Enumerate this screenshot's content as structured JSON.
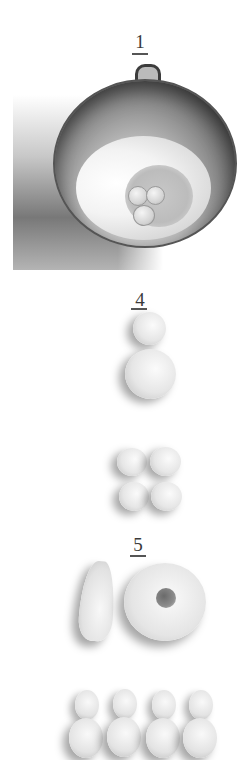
{
  "figure": {
    "steps": [
      {
        "number": "1",
        "subject": "Metal mixing bowl with flour and eggs in a well"
      },
      {
        "number": "4",
        "subject": "Dough balls: one small, one large, then four small balls in a 2x2 group"
      },
      {
        "number": "5",
        "subject": "Shaped dough: teardrop and ring (donut), then four peanut/figure-eight shapes in a row"
      }
    ],
    "palette": {
      "background": "#ffffff",
      "numeral": "#3a3a3a",
      "bowl_dark": "#2f2f2f",
      "dough": "#e6e6e6"
    }
  }
}
